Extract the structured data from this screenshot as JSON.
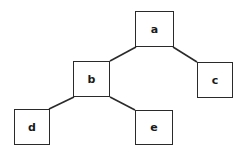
{
  "diagram": {
    "type": "tree",
    "stroke_color": "#2a2a2a",
    "nodes": [
      {
        "id": "a",
        "label": "a",
        "x": 135,
        "y": 11,
        "w": 39,
        "h": 36
      },
      {
        "id": "b",
        "label": "b",
        "x": 73,
        "y": 61,
        "w": 37,
        "h": 36
      },
      {
        "id": "c",
        "label": "c",
        "x": 197,
        "y": 62,
        "w": 36,
        "h": 36
      },
      {
        "id": "d",
        "label": "d",
        "x": 14,
        "y": 109,
        "w": 36,
        "h": 36
      },
      {
        "id": "e",
        "label": "e",
        "x": 135,
        "y": 110,
        "w": 38,
        "h": 35
      }
    ],
    "edges": [
      {
        "from": "a",
        "to": "b",
        "x1": 136,
        "y1": 47,
        "x2": 110,
        "y2": 61
      },
      {
        "from": "a",
        "to": "c",
        "x1": 173,
        "y1": 47,
        "x2": 197,
        "y2": 62
      },
      {
        "from": "b",
        "to": "d",
        "x1": 74,
        "y1": 97,
        "x2": 49,
        "y2": 109
      },
      {
        "from": "b",
        "to": "e",
        "x1": 110,
        "y1": 97,
        "x2": 135,
        "y2": 110
      }
    ]
  }
}
